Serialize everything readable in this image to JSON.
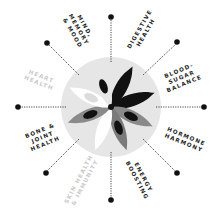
{
  "diagram": {
    "center": {
      "x": 111,
      "y": 107
    },
    "colors": {
      "background": "#ffffff",
      "disk": "#e6e6e6",
      "petal_black": "#111111",
      "petal_dark_grey": "#7a7a7a",
      "petal_white": "#ffffff",
      "petal_light_grey": "#c8c8c8",
      "text": "#222222",
      "text_faded": "#c9c9c9",
      "connector": "#222222"
    },
    "benefits": [
      {
        "id": "mind",
        "lines": [
          "MIND,",
          "MEMORY",
          "& MOOD"
        ],
        "faded": false
      },
      {
        "id": "digestive",
        "lines": [
          "DIGESTIVE",
          "HEALTH"
        ],
        "faded": false
      },
      {
        "id": "blood-sugar",
        "lines": [
          "BLOOD-",
          "SUGAR",
          "BALANCE"
        ],
        "faded": false
      },
      {
        "id": "hormone",
        "lines": [
          "HORMONE",
          "HARMONY"
        ],
        "faded": false
      },
      {
        "id": "energy",
        "lines": [
          "ENERGY",
          "BOOSTING"
        ],
        "faded": false
      },
      {
        "id": "skin",
        "lines": [
          "SKIN HEALTH",
          "& IMMUNITY"
        ],
        "faded": true
      },
      {
        "id": "bone",
        "lines": [
          "BONE &",
          "JOINT",
          "HEALTH"
        ],
        "faded": false
      },
      {
        "id": "heart",
        "lines": [
          "HEART",
          "HEALTH"
        ],
        "faded": true
      }
    ]
  }
}
